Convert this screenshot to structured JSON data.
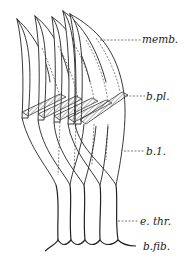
{
  "figure": {
    "type": "anatomical line drawing",
    "line_color": "#222222",
    "hatch_color": "#999999",
    "labels": [
      {
        "id": "memb",
        "text": "memb.",
        "x": 143,
        "y": 31
      },
      {
        "id": "bpl",
        "text": "b.pl.",
        "x": 146,
        "y": 91
      },
      {
        "id": "b1",
        "text": "b.1.",
        "x": 146,
        "y": 146
      },
      {
        "id": "ethr",
        "text": "e. thr.",
        "x": 140,
        "y": 212
      },
      {
        "id": "bfib",
        "text": "b.fib.",
        "x": 143,
        "y": 239
      }
    ]
  }
}
